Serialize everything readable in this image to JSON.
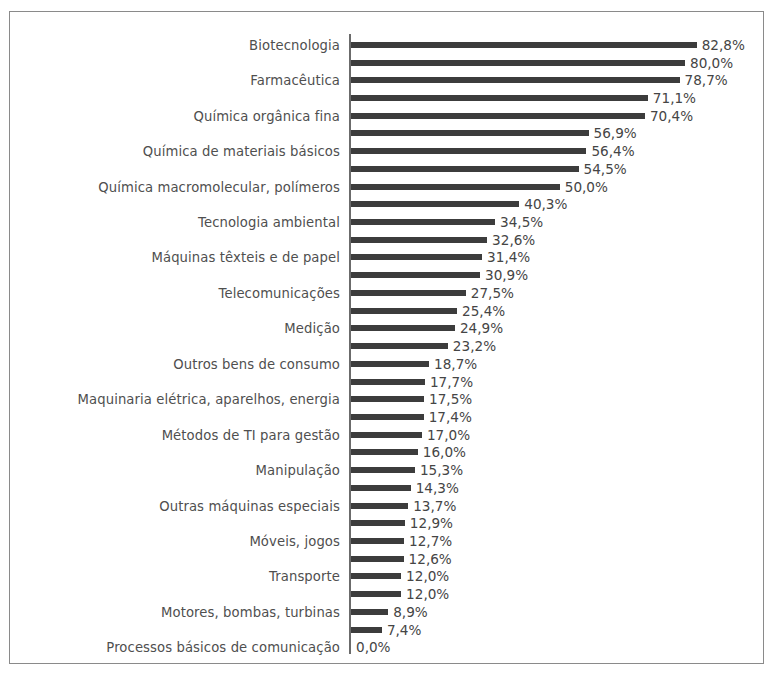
{
  "chart": {
    "type": "bar",
    "orientation": "horizontal",
    "title": "",
    "xlabel": "",
    "ylabel": "",
    "grid": false,
    "legend": false,
    "bar_color": "#3c3c3c",
    "text_color": "#4f4f4f",
    "border_color": "#8a8a8a",
    "axis_color": "#6b6b6b",
    "value_suffix": "%",
    "decimal_separator": ",",
    "xlim": [
      0,
      82.8
    ],
    "px_per_unit": 4.175,
    "label_every_nth": 2
  },
  "chart_data": {
    "type": "bar",
    "title": "",
    "xlabel": "",
    "ylabel": "",
    "xlim": [
      0,
      82.8
    ],
    "grid": false,
    "legend_position": "none",
    "categories": [
      "Biotecnologia",
      "",
      "Farmacêutica",
      "",
      "Química orgânica fina",
      "",
      "Química de materiais básicos",
      "",
      "Química macromolecular, polímeros",
      "",
      "Tecnologia ambiental",
      "",
      "Máquinas têxteis e de papel",
      "",
      "Telecomunicações",
      "",
      "Medição",
      "",
      "Outros bens de consumo",
      "",
      "Maquinaria elétrica, aparelhos, energia",
      "",
      "Métodos de TI para gestão",
      "",
      "Manipulação",
      "",
      "Outras máquinas especiais",
      "",
      "Móveis, jogos",
      "",
      "Transporte",
      "",
      "Motores, bombas, turbinas",
      "",
      "Processos básicos de comunicação"
    ],
    "values": [
      82.8,
      80.0,
      78.7,
      71.1,
      70.4,
      56.9,
      56.4,
      54.5,
      50.0,
      40.3,
      34.5,
      32.6,
      31.4,
      30.9,
      27.5,
      25.4,
      24.9,
      23.2,
      18.7,
      17.7,
      17.5,
      17.4,
      17.0,
      16.0,
      15.3,
      14.3,
      13.7,
      12.9,
      12.7,
      12.6,
      12.0,
      12.0,
      8.9,
      7.4,
      0.0
    ],
    "value_labels": [
      "82,8%",
      "80,0%",
      "78,7%",
      "71,1%",
      "70,4%",
      "56,9%",
      "56,4%",
      "54,5%",
      "50,0%",
      "40,3%",
      "34,5%",
      "32,6%",
      "31,4%",
      "30,9%",
      "27,5%",
      "25,4%",
      "24,9%",
      "23,2%",
      "18,7%",
      "17,7%",
      "17,5%",
      "17,4%",
      "17,0%",
      "16,0%",
      "15,3%",
      "14,3%",
      "13,7%",
      "12,9%",
      "12,7%",
      "12,6%",
      "12,0%",
      "12,0%",
      "8,9%",
      "7,4%",
      "0,0%"
    ]
  }
}
